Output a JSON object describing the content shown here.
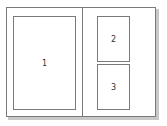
{
  "diagram": {
    "type": "page-layout",
    "sheet": {
      "columns": 2,
      "border_color": "#7a7a7a",
      "shadow_color": "#c8c8c8"
    },
    "panels": [
      {
        "label": "1",
        "column": "left",
        "span": "full-height"
      },
      {
        "label": "2",
        "column": "right",
        "position": "top"
      },
      {
        "label": "3",
        "column": "right",
        "position": "bottom"
      }
    ]
  }
}
